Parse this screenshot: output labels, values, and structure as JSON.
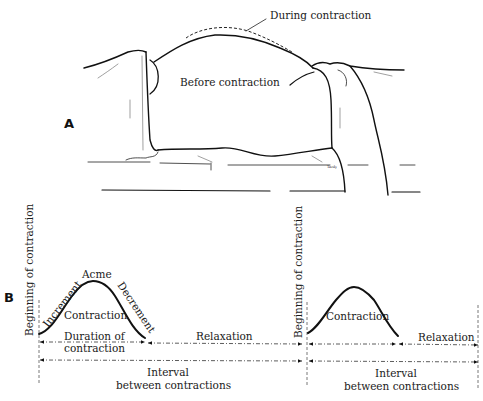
{
  "panel_a": {
    "letter": "A",
    "label_during": "During contraction",
    "label_before": "Before contraction",
    "signature": "Tardy"
  },
  "panel_b": {
    "letter": "B",
    "first_cycle": {
      "beginning_label": "Beginning of contraction",
      "increment_label": "Increment",
      "acme_label": "Acme",
      "decrement_label": "Decrement",
      "contraction_label": "Contraction",
      "duration_label_line1": "Duration of",
      "duration_label_line2": "contraction",
      "relaxation_label": "Relaxation",
      "interval_label_line1": "Interval",
      "interval_label_line2": "between contractions"
    },
    "second_cycle": {
      "beginning_label": "Beginning of contraction",
      "contraction_label": "Contraction",
      "relaxation_label": "Relaxation",
      "interval_label_line1": "Interval",
      "interval_label_line2": "between contractions"
    }
  },
  "colors": {
    "background": "#ffffff",
    "ink": "#111111"
  }
}
